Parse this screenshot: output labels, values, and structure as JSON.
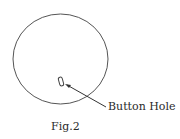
{
  "figure": {
    "caption": "Fig.2",
    "callout_label": "Button Hole",
    "stroke_color": "#555555",
    "text_color": "#2a2a2a"
  }
}
